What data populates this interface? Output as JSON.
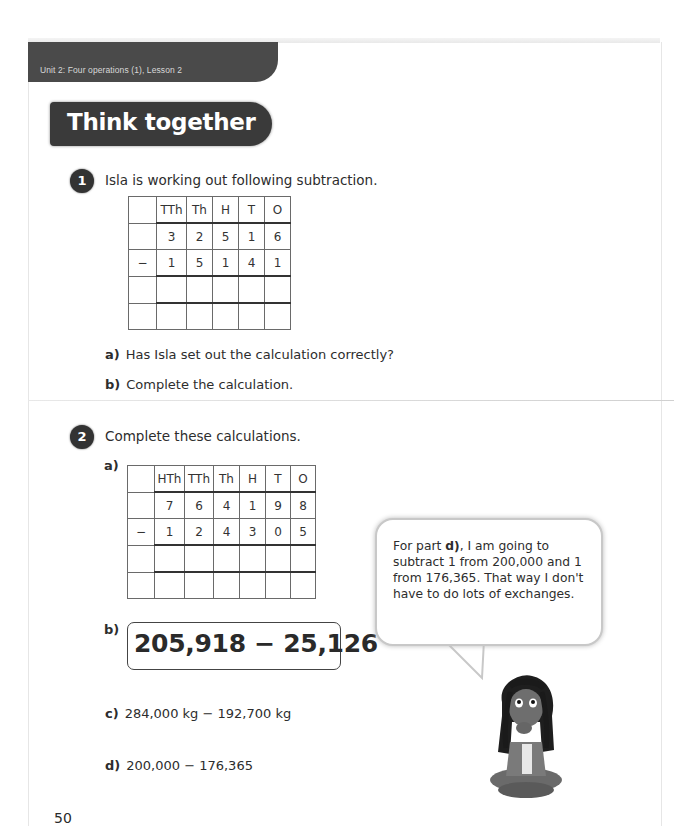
{
  "header": {
    "unit_label": "Unit 2: Four operations (1), Lesson 2",
    "section_title": "Think together"
  },
  "question1": {
    "number": "1",
    "prompt": "Isla is working out following subtraction.",
    "table": {
      "headers": [
        "",
        "TTh",
        "Th",
        "H",
        "T",
        "O"
      ],
      "rows": [
        [
          "",
          "3",
          "2",
          "5",
          "1",
          "6"
        ],
        [
          "−",
          "1",
          "5",
          "1",
          "4",
          "1"
        ],
        [
          "",
          "",
          "",
          "",
          "",
          ""
        ],
        [
          "",
          "",
          "",
          "",
          "",
          ""
        ]
      ]
    },
    "parts": [
      {
        "label": "a)",
        "text": "Has Isla set out the calculation correctly?"
      },
      {
        "label": "b)",
        "text": "Complete the calculation."
      }
    ]
  },
  "question2": {
    "number": "2",
    "prompt": "Complete these calculations.",
    "part_a": {
      "label": "a)",
      "table": {
        "headers": [
          "",
          "HTh",
          "TTh",
          "Th",
          "H",
          "T",
          "O"
        ],
        "rows": [
          [
            "",
            "7",
            "6",
            "4",
            "1",
            "9",
            "8"
          ],
          [
            "−",
            "1",
            "2",
            "4",
            "3",
            "0",
            "5"
          ],
          [
            "",
            "",
            "",
            "",
            "",
            "",
            ""
          ],
          [
            "",
            "",
            "",
            "",
            "",
            "",
            ""
          ]
        ]
      }
    },
    "part_b": {
      "label": "b)",
      "expression": "205,918 − 25,126"
    },
    "part_c": {
      "label": "c)",
      "expression": "284,000 kg − 192,700 kg"
    },
    "part_d": {
      "label": "d)",
      "expression": "200,000 − 176,365"
    }
  },
  "speech_bubble": {
    "text_before": "For part ",
    "text_bold": "d)",
    "text_after": ", I am going to subtract 1 from 200,000 and 1 from 176,365. That way I don't have to do lots of exchanges."
  },
  "character": {
    "icon": "girl-thinking-icon"
  },
  "footer": {
    "page_number": "50"
  }
}
